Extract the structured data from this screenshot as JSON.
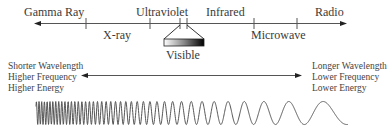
{
  "diagram": {
    "bands_above_axis": [
      {
        "id": "gamma",
        "label": "Gamma Ray"
      },
      {
        "id": "uv",
        "label": "Ultraviolet"
      },
      {
        "id": "ir",
        "label": "Infrared"
      },
      {
        "id": "radio",
        "label": "Radio"
      }
    ],
    "bands_below_axis": [
      {
        "id": "xray",
        "label": "X-ray"
      },
      {
        "id": "microwave",
        "label": "Microwave"
      }
    ],
    "visible": {
      "label": "Visible",
      "gradient_from": "#ffffff",
      "gradient_to": "#000000"
    },
    "left_side": {
      "lines": [
        "Shorter Wavelength",
        "Higher Frequency",
        "Higher Energy"
      ]
    },
    "right_side": {
      "lines": [
        "Longer Wavelength",
        "Lower Frequency",
        "Lower Energy"
      ]
    },
    "wave": {
      "description": "Sine wave with decreasing frequency from left to right"
    },
    "colors": {
      "line": "#555555",
      "text": "#3a3a3a"
    }
  }
}
